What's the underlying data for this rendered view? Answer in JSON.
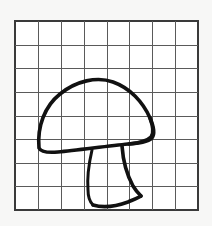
{
  "image": {
    "title": "Mushroom line drawing on grid paper",
    "subject": "mushroom",
    "style": "black outline sketch",
    "background_color": "#f7f7f6",
    "paper_color": "#ffffff"
  },
  "grid": {
    "name": "square-grid",
    "columns": 8,
    "rows": 8,
    "x": 15,
    "y": 21,
    "width": 183,
    "height": 189,
    "cell_width": 22.875,
    "cell_height": 23.625,
    "line_color": "#5a5a5a",
    "border_color": "#3a3a3a"
  },
  "drawing": {
    "name": "mushroom-sketch",
    "stroke_color": "#111111",
    "stroke_width": 3.6,
    "parts": [
      {
        "name": "mushroom-cap",
        "label": "Cap",
        "path": "M 39 148 C 37 126 45 106 60 94 C 76 81 97 76 113 82 C 130 88 143 102 150 118 C 154 127 155 134 152 138 C 148 142 139 143 128 144 C 108 146 78 150 58 152 C 47 153 41 152 39 148 Z"
      },
      {
        "name": "cap-right-tip",
        "label": "Cap right tip",
        "path": "M 150 118 C 153 126 154 133 151 137 C 147 141 139 143 129 144"
      },
      {
        "name": "stem-left-edge",
        "label": "Stem left side",
        "path": "M 92 150 C 89 163 87 178 88 190 C 88 197 90 202 93 205"
      },
      {
        "name": "stem-right-edge",
        "label": "Stem right side",
        "path": "M 122 146 C 123 160 127 175 133 186 C 136 191 139 194 141 196"
      },
      {
        "name": "stem-base",
        "label": "Stem base",
        "path": "M 93 205 C 103 208 117 206 128 202 C 135 199 140 197 141 196"
      }
    ]
  }
}
